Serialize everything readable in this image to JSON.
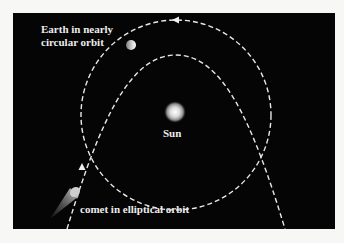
{
  "diagram": {
    "background_color": "#050505",
    "orbit_color": "#e8e8e8",
    "labels": {
      "earth": [
        "Earth in nearly",
        "circular orbit"
      ],
      "sun": "Sun",
      "comet": "comet in elliptical orbit"
    },
    "objects": [
      "sun",
      "earth",
      "comet"
    ]
  }
}
